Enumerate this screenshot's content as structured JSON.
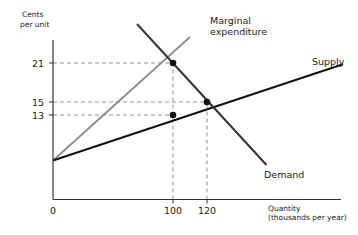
{
  "chart_data": {
    "type": "line",
    "title": "",
    "xlabel": "Quantity",
    "xlabel_sub": "(thousands per year)",
    "ylabel": "Cents",
    "ylabel_sub": "per unit",
    "x_origin_label": "0",
    "xlim": [
      0,
      200
    ],
    "ylim": [
      0,
      27
    ],
    "grid": false,
    "x_ticks": [
      {
        "value": 100,
        "label": "100"
      },
      {
        "value": 120,
        "label": "120"
      }
    ],
    "y_ticks": [
      {
        "value": 21,
        "label": "21"
      },
      {
        "value": 15,
        "label": "15"
      },
      {
        "value": 13,
        "label": "13"
      }
    ],
    "series": [
      {
        "name": "Marginal expenditure",
        "label": "Marginal",
        "label2": "expenditure",
        "color": "#8c8c8c",
        "points": [
          [
            0,
            6
          ],
          [
            110,
            25
          ]
        ]
      },
      {
        "name": "Supply",
        "label": "Supply",
        "color": "#111111",
        "points": [
          [
            0,
            6
          ],
          [
            200,
            20.8
          ]
        ]
      },
      {
        "name": "Demand",
        "label": "Demand",
        "color": "#333333",
        "points": [
          [
            70,
            27
          ],
          [
            155,
            5.3
          ]
        ]
      }
    ],
    "points": [
      {
        "x": 100,
        "y": 21,
        "label": "monopsony-wage-point"
      },
      {
        "x": 120,
        "y": 15,
        "label": "competitive-equilibrium"
      },
      {
        "x": 100,
        "y": 13,
        "label": "supply-at-monopsony-quantity"
      }
    ],
    "guides": [
      {
        "from": [
          0,
          21
        ],
        "to": [
          100,
          21
        ]
      },
      {
        "from": [
          0,
          15
        ],
        "to": [
          120,
          15
        ]
      },
      {
        "from": [
          0,
          13
        ],
        "to": [
          100,
          13
        ]
      },
      {
        "from": [
          100,
          0
        ],
        "to": [
          100,
          21
        ]
      },
      {
        "from": [
          120,
          0
        ],
        "to": [
          120,
          15
        ]
      }
    ]
  }
}
